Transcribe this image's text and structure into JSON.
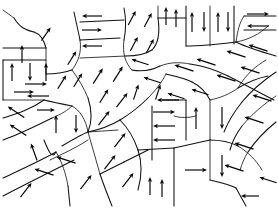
{
  "figure": {
    "name": "magnetic-domain-structure",
    "width": 278,
    "height": 210,
    "background_color": "#ffffff",
    "line_color": "#111111",
    "arrow_color": "#000000",
    "caption": "",
    "axis_labels": [],
    "legend": [],
    "visible_text": []
  },
  "chart_data": {
    "type": "diagram",
    "domain_count": 38,
    "arrow_count": 72,
    "xlabel": "",
    "ylabel": "",
    "grid": false,
    "legend_position": "none",
    "walls": [
      "M 14,18 C 20,28 26,30 34,32",
      "M 34,32 C 40,34 44,40 46,48",
      "M 46,48 L 46,74",
      "M 3,60 L 46,60",
      "M 3,60 L 3,100",
      "M 3,100 L 44,100",
      "M 46,48 L 3,48",
      "M 74,12 C 76,22 78,30 80,40",
      "M 80,40 C 82,52 78,62 72,70",
      "M 46,74 C 56,74 66,72 72,70",
      "M 80,40 L 120,38",
      "M 80,58 L 126,56",
      "M 80,22 L 124,20",
      "M 124,8 C 126,18 126,30 124,40",
      "M 124,40 C 122,54 126,64 132,70",
      "M 126,56 C 136,56 146,54 152,50",
      "M 152,50 C 158,44 160,32 158,18",
      "M 158,18 L 158,6",
      "M 158,18 C 168,18 178,18 186,18",
      "M 186,6 L 186,46",
      "M 210,6 L 210,46",
      "M 234,6 L 234,44",
      "M 186,46 C 200,46 220,44 236,42",
      "M 236,42 C 248,40 260,34 268,26",
      "M 244,16 L 276,16",
      "M 244,30 L 276,30",
      "M 244,16 C 240,22 238,28 236,42",
      "M 236,42 C 248,48 262,52 276,56",
      "M 132,70 C 142,72 152,70 160,66",
      "M 160,66 C 170,62 180,62 190,64",
      "M 190,64 C 204,66 216,70 228,76",
      "M 228,76 C 244,84 258,92 274,100",
      "M 72,70 C 78,78 84,88 88,98",
      "M 88,98 C 92,110 92,122 88,132",
      "M 44,100 C 52,102 62,104 72,106",
      "M 72,106 C 80,110 86,120 88,132",
      "M 3,118 C 16,114 30,110 44,100",
      "M 3,140 C 20,134 36,126 52,118",
      "M 52,118 C 62,114 68,110 72,106",
      "M 88,132 C 98,130 110,126 120,120",
      "M 120,120 C 130,114 140,106 148,98",
      "M 148,98 C 156,90 162,82 166,74",
      "M 120,120 C 128,128 134,138 138,150",
      "M 138,150 C 142,162 142,176 138,190",
      "M 88,132 C 92,146 96,160 100,174",
      "M 100,174 C 104,186 108,196 112,206",
      "M 62,146 C 72,140 82,134 88,132",
      "M 50,160 C 62,154 76,148 88,140",
      "M 3,178 C 20,170 38,162 56,152",
      "M 3,196 C 26,184 50,172 74,160",
      "M 56,152 C 62,162 66,174 68,186",
      "M 68,186 L 70,206",
      "M 44,140 C 48,150 52,160 56,152",
      "M 88,132 L 118,130",
      "M 152,106 L 152,160",
      "M 138,150 L 174,148",
      "M 174,116 C 180,118 188,118 196,116",
      "M 166,74 C 174,76 184,78 192,82",
      "M 192,82 C 200,86 206,92 210,100",
      "M 210,100 L 210,140",
      "M 186,100 L 186,140",
      "M 162,100 C 170,100 180,100 186,100",
      "M 210,100 C 220,98 230,94 238,88",
      "M 238,88 C 248,82 258,78 268,76",
      "M 210,140 C 220,140 230,142 238,146",
      "M 238,146 C 248,152 256,160 262,170",
      "M 210,140 L 174,148",
      "M 174,148 L 174,206",
      "M 210,140 L 210,180",
      "M 210,180 C 218,182 228,184 236,188",
      "M 236,188 L 246,206",
      "M 266,60 C 256,66 246,74 238,88",
      "M 276,72 C 264,80 252,90 242,102",
      "M 242,102 C 234,112 228,122 224,132",
      "M 276,96 C 264,104 252,114 242,126",
      "M 242,126 C 236,134 232,142 230,150",
      "M 276,122 C 266,130 256,140 248,152",
      "M 248,152 C 244,158 242,164 240,170",
      "M 100,174 C 108,170 116,166 124,162",
      "M 124,162 C 132,158 140,154 148,150",
      "M 14,18 L 3,10"
    ],
    "arrows": [
      {
        "id": "a1",
        "x": 46,
        "y": 34,
        "angle": -55,
        "length": 16,
        "direction": "up-right"
      },
      {
        "id": "a2",
        "x": 92,
        "y": 16,
        "angle": 180,
        "length": 20,
        "direction": "left"
      },
      {
        "id": "a3",
        "x": 92,
        "y": 30,
        "angle": 0,
        "length": 20,
        "direction": "right"
      },
      {
        "id": "a4",
        "x": 92,
        "y": 46,
        "angle": 180,
        "length": 20,
        "direction": "left"
      },
      {
        "id": "a5",
        "x": 132,
        "y": 18,
        "angle": -62,
        "length": 16,
        "direction": "up-right"
      },
      {
        "id": "a6",
        "x": 148,
        "y": 20,
        "angle": -62,
        "length": 16,
        "direction": "up-right"
      },
      {
        "id": "a7",
        "x": 134,
        "y": 44,
        "angle": -62,
        "length": 16,
        "direction": "up-right"
      },
      {
        "id": "a8",
        "x": 150,
        "y": 46,
        "angle": -62,
        "length": 16,
        "direction": "up-right"
      },
      {
        "id": "a9",
        "x": 166,
        "y": 16,
        "angle": -90,
        "length": 18,
        "direction": "up"
      },
      {
        "id": "a10",
        "x": 176,
        "y": 18,
        "angle": -90,
        "length": 18,
        "direction": "up"
      },
      {
        "id": "a11",
        "x": 192,
        "y": 22,
        "angle": -90,
        "length": 20,
        "direction": "up"
      },
      {
        "id": "a12",
        "x": 204,
        "y": 22,
        "angle": 90,
        "length": 20,
        "direction": "down"
      },
      {
        "id": "a13",
        "x": 218,
        "y": 22,
        "angle": -90,
        "length": 20,
        "direction": "up"
      },
      {
        "id": "a14",
        "x": 228,
        "y": 22,
        "angle": 90,
        "length": 20,
        "direction": "down"
      },
      {
        "id": "a15",
        "x": 258,
        "y": 14,
        "angle": 0,
        "length": 22,
        "direction": "right"
      },
      {
        "id": "a16",
        "x": 258,
        "y": 26,
        "angle": 180,
        "length": 22,
        "direction": "left"
      },
      {
        "id": "a17",
        "x": 22,
        "y": 54,
        "angle": -90,
        "length": 18,
        "direction": "up"
      },
      {
        "id": "a18",
        "x": 12,
        "y": 72,
        "angle": -90,
        "length": 18,
        "direction": "up"
      },
      {
        "id": "a19",
        "x": 30,
        "y": 72,
        "angle": 90,
        "length": 18,
        "direction": "down"
      },
      {
        "id": "a20",
        "x": 46,
        "y": 72,
        "angle": -90,
        "length": 18,
        "direction": "up"
      },
      {
        "id": "a21",
        "x": 24,
        "y": 92,
        "angle": 0,
        "length": 20,
        "direction": "right"
      },
      {
        "id": "a22",
        "x": 72,
        "y": 58,
        "angle": -58,
        "length": 16,
        "direction": "up-right"
      },
      {
        "id": "a23",
        "x": 62,
        "y": 82,
        "angle": -58,
        "length": 16,
        "direction": "up-right"
      },
      {
        "id": "a24",
        "x": 78,
        "y": 80,
        "angle": -58,
        "length": 16,
        "direction": "up-right"
      },
      {
        "id": "a25",
        "x": 98,
        "y": 76,
        "angle": -58,
        "length": 18,
        "direction": "up-right"
      },
      {
        "id": "a26",
        "x": 118,
        "y": 74,
        "angle": -58,
        "length": 18,
        "direction": "up-right"
      },
      {
        "id": "a27",
        "x": 104,
        "y": 96,
        "angle": -58,
        "length": 16,
        "direction": "up-right"
      },
      {
        "id": "a28",
        "x": 140,
        "y": 62,
        "angle": 198,
        "length": 18,
        "direction": "left-down"
      },
      {
        "id": "a29",
        "x": 152,
        "y": 80,
        "angle": 198,
        "length": 18,
        "direction": "left-down"
      },
      {
        "id": "a30",
        "x": 136,
        "y": 92,
        "angle": -72,
        "length": 16,
        "direction": "up"
      },
      {
        "id": "a31",
        "x": 158,
        "y": 92,
        "angle": -72,
        "length": 16,
        "direction": "up"
      },
      {
        "id": "a32",
        "x": 184,
        "y": 68,
        "angle": 198,
        "length": 20,
        "direction": "left-down"
      },
      {
        "id": "a33",
        "x": 206,
        "y": 62,
        "angle": 198,
        "length": 20,
        "direction": "left-down"
      },
      {
        "id": "a34",
        "x": 236,
        "y": 54,
        "angle": 198,
        "length": 20,
        "direction": "left-down"
      },
      {
        "id": "a35",
        "x": 258,
        "y": 48,
        "angle": 198,
        "length": 20,
        "direction": "left-down"
      },
      {
        "id": "a36",
        "x": 226,
        "y": 78,
        "angle": 198,
        "length": 20,
        "direction": "left-down"
      },
      {
        "id": "a37",
        "x": 250,
        "y": 70,
        "angle": 198,
        "length": 20,
        "direction": "left-down"
      },
      {
        "id": "a38",
        "x": 176,
        "y": 96,
        "angle": 198,
        "length": 18,
        "direction": "left-down"
      },
      {
        "id": "a39",
        "x": 200,
        "y": 92,
        "angle": 198,
        "length": 18,
        "direction": "left-down"
      },
      {
        "id": "a40",
        "x": 16,
        "y": 112,
        "angle": 214,
        "length": 20,
        "direction": "left-up"
      },
      {
        "id": "a41",
        "x": 18,
        "y": 130,
        "angle": 214,
        "length": 20,
        "direction": "left-up"
      },
      {
        "id": "a42",
        "x": 34,
        "y": 152,
        "angle": 250,
        "length": 18,
        "direction": "up-left"
      },
      {
        "id": "a43",
        "x": 56,
        "y": 124,
        "angle": -90,
        "length": 18,
        "direction": "up"
      },
      {
        "id": "a44",
        "x": 76,
        "y": 124,
        "angle": 90,
        "length": 18,
        "direction": "down"
      },
      {
        "id": "a45",
        "x": 46,
        "y": 110,
        "angle": 0,
        "length": 18,
        "direction": "right"
      },
      {
        "id": "a46",
        "x": 38,
        "y": 96,
        "angle": 180,
        "length": 22,
        "direction": "left"
      },
      {
        "id": "a47",
        "x": 36,
        "y": 84,
        "angle": 0,
        "length": 22,
        "direction": "right"
      },
      {
        "id": "a48",
        "x": 104,
        "y": 118,
        "angle": -52,
        "length": 18,
        "direction": "up-right"
      },
      {
        "id": "a49",
        "x": 122,
        "y": 100,
        "angle": -52,
        "length": 18,
        "direction": "up-right"
      },
      {
        "id": "a50",
        "x": 44,
        "y": 172,
        "angle": 198,
        "length": 20,
        "direction": "left-down"
      },
      {
        "id": "a51",
        "x": 66,
        "y": 160,
        "angle": 198,
        "length": 20,
        "direction": "left-down"
      },
      {
        "id": "a52",
        "x": 26,
        "y": 190,
        "angle": -52,
        "length": 18,
        "direction": "up-right"
      },
      {
        "id": "a53",
        "x": 86,
        "y": 182,
        "angle": -52,
        "length": 18,
        "direction": "up-right"
      },
      {
        "id": "a54",
        "x": 110,
        "y": 162,
        "angle": -52,
        "length": 18,
        "direction": "up-right"
      },
      {
        "id": "a55",
        "x": 120,
        "y": 140,
        "angle": -52,
        "length": 18,
        "direction": "up-right"
      },
      {
        "id": "a56",
        "x": 128,
        "y": 180,
        "angle": -52,
        "length": 18,
        "direction": "up-right"
      },
      {
        "id": "a57",
        "x": 150,
        "y": 186,
        "angle": -90,
        "length": 18,
        "direction": "up"
      },
      {
        "id": "a58",
        "x": 162,
        "y": 188,
        "angle": -90,
        "length": 18,
        "direction": "up"
      },
      {
        "id": "a59",
        "x": 164,
        "y": 140,
        "angle": 180,
        "length": 22,
        "direction": "left"
      },
      {
        "id": "a60",
        "x": 164,
        "y": 126,
        "angle": 180,
        "length": 22,
        "direction": "left"
      },
      {
        "id": "a61",
        "x": 164,
        "y": 112,
        "angle": 0,
        "length": 22,
        "direction": "right"
      },
      {
        "id": "a62",
        "x": 168,
        "y": 100,
        "angle": 180,
        "length": 22,
        "direction": "left"
      },
      {
        "id": "a63",
        "x": 196,
        "y": 118,
        "angle": -90,
        "length": 22,
        "direction": "up"
      },
      {
        "id": "a64",
        "x": 196,
        "y": 170,
        "angle": 0,
        "length": 22,
        "direction": "right"
      },
      {
        "id": "a65",
        "x": 222,
        "y": 118,
        "angle": 90,
        "length": 22,
        "direction": "down"
      },
      {
        "id": "a66",
        "x": 222,
        "y": 166,
        "angle": 90,
        "length": 22,
        "direction": "down"
      },
      {
        "id": "a67",
        "x": 244,
        "y": 146,
        "angle": 198,
        "length": 20,
        "direction": "left-down"
      },
      {
        "id": "a68",
        "x": 234,
        "y": 168,
        "angle": 198,
        "length": 20,
        "direction": "left-down"
      },
      {
        "id": "a69",
        "x": 254,
        "y": 120,
        "angle": 198,
        "length": 20,
        "direction": "left-down"
      },
      {
        "id": "a70",
        "x": 262,
        "y": 98,
        "angle": 198,
        "length": 20,
        "direction": "left-down"
      },
      {
        "id": "a71",
        "x": 268,
        "y": 180,
        "angle": 198,
        "length": 18,
        "direction": "left-down"
      },
      {
        "id": "a72",
        "x": 250,
        "y": 196,
        "angle": 180,
        "length": 18,
        "direction": "left"
      }
    ]
  }
}
